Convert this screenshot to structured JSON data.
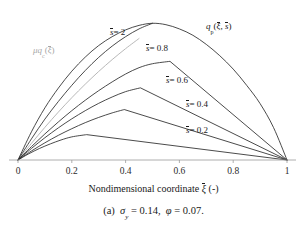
{
  "figure": {
    "caption_prefix": "(a)",
    "caption_sigma": "σ",
    "caption_sigma_sub": "y",
    "caption_sigma_val": "= 0.14,",
    "caption_phi": "φ",
    "caption_phi_val": "= 0.07."
  },
  "axis": {
    "title_text": "Nondimensional coordinate",
    "title_symbol": "ξ",
    "title_units": "(-)",
    "tick_labels": [
      "0",
      "0.2",
      "0.4",
      "0.6",
      "0.8",
      "1"
    ],
    "tick_values": [
      0,
      0.2,
      0.4,
      0.6,
      0.8,
      1
    ],
    "xlim": [
      0,
      1
    ]
  },
  "annotations": {
    "envelope": {
      "symbol": "q",
      "subscript": "p",
      "args_open": "(",
      "arg1": "ξ",
      "comma": ", ",
      "arg2": "s",
      "args_close": ")"
    },
    "elastic": {
      "mu": "μ",
      "symbol": "q",
      "subscript": "c",
      "args_open": "(",
      "arg1": "ξ",
      "args_close": ")"
    },
    "curve_labels": [
      {
        "name": "s-eq-2",
        "sym": "s",
        "eq": "= 2"
      },
      {
        "name": "s-eq-0p8",
        "sym": "s",
        "eq": "= 0.8"
      },
      {
        "name": "s-eq-0p6",
        "sym": "s",
        "eq": "= 0.6"
      },
      {
        "name": "s-eq-0p4",
        "sym": "s",
        "eq": "= 0.4"
      },
      {
        "name": "s-eq-0p2",
        "sym": "s",
        "eq": "= 0.2"
      }
    ]
  },
  "chart_data": {
    "type": "line",
    "title": "",
    "xlabel": "Nondimensional coordinate ξ (-)",
    "ylabel": "",
    "xlim": [
      0,
      1
    ],
    "ylim": [
      0,
      1.05
    ],
    "grid": false,
    "legend": "inline-annotations",
    "colors": {
      "curve": "#2b2b2b",
      "elastic": "#b0b0b0",
      "axis": "#9a9a9a"
    },
    "series": [
      {
        "name": "mu q_c(xi)",
        "style": "gray-line",
        "label": "μq_c(ξ)",
        "x": [
          0,
          0.05,
          0.1,
          0.15,
          0.2,
          0.25,
          0.3,
          0.35,
          0.4,
          0.45
        ],
        "y": [
          0,
          0.118,
          0.232,
          0.34,
          0.442,
          0.538,
          0.628,
          0.712,
          0.79,
          0.862
        ]
      },
      {
        "name": "q_p envelope",
        "style": "solid",
        "label": "q_p(ξ, s)",
        "x": [
          0,
          0.05,
          0.1,
          0.15,
          0.2,
          0.25,
          0.3,
          0.35,
          0.4,
          0.45,
          0.5,
          0.55,
          0.6,
          0.65,
          0.7,
          0.75,
          0.8,
          0.85,
          0.9,
          0.95,
          1.0
        ],
        "y": [
          0,
          0.2,
          0.37,
          0.51,
          0.63,
          0.73,
          0.812,
          0.875,
          0.923,
          0.955,
          0.97,
          0.96,
          0.93,
          0.885,
          0.82,
          0.74,
          0.645,
          0.53,
          0.4,
          0.23,
          0.0
        ]
      },
      {
        "name": "s = 2",
        "style": "solid",
        "label": "s = 2",
        "branch_point": [
          0.5,
          0.97
        ],
        "x": [
          0,
          0.05,
          0.1,
          0.15,
          0.2,
          0.25,
          0.3,
          0.35,
          0.4,
          0.45,
          0.5
        ],
        "y": [
          0,
          0.15,
          0.29,
          0.415,
          0.53,
          0.635,
          0.728,
          0.808,
          0.875,
          0.93,
          0.97
        ]
      },
      {
        "name": "s = 0.8",
        "style": "solid",
        "label": "s = 0.8",
        "branch_point": [
          0.565,
          0.7
        ],
        "x": [
          0,
          0.05,
          0.1,
          0.15,
          0.2,
          0.25,
          0.3,
          0.35,
          0.4,
          0.45,
          0.5,
          0.565,
          1.0
        ],
        "y": [
          0,
          0.095,
          0.185,
          0.27,
          0.35,
          0.424,
          0.492,
          0.554,
          0.61,
          0.655,
          0.683,
          0.7,
          0.0
        ]
      },
      {
        "name": "s = 0.6",
        "style": "solid",
        "label": "s = 0.6",
        "branch_point": [
          0.455,
          0.512
        ],
        "x": [
          0,
          0.05,
          0.1,
          0.15,
          0.2,
          0.25,
          0.3,
          0.35,
          0.4,
          0.455,
          1.0
        ],
        "y": [
          0,
          0.082,
          0.158,
          0.228,
          0.292,
          0.35,
          0.402,
          0.447,
          0.485,
          0.512,
          0.0
        ]
      },
      {
        "name": "s = 0.4",
        "style": "solid",
        "label": "s = 0.4",
        "branch_point": [
          0.395,
          0.358
        ],
        "x": [
          0,
          0.05,
          0.1,
          0.15,
          0.2,
          0.25,
          0.3,
          0.35,
          0.395,
          1.0
        ],
        "y": [
          0,
          0.064,
          0.122,
          0.175,
          0.222,
          0.265,
          0.302,
          0.334,
          0.358,
          0.0
        ]
      },
      {
        "name": "s = 0.2",
        "style": "solid",
        "label": "s = 0.2",
        "branch_point": [
          0.255,
          0.18
        ],
        "x": [
          0,
          0.04,
          0.08,
          0.12,
          0.16,
          0.2,
          0.255,
          1.0
        ],
        "y": [
          0,
          0.044,
          0.082,
          0.114,
          0.142,
          0.164,
          0.18,
          0.0
        ]
      }
    ]
  }
}
